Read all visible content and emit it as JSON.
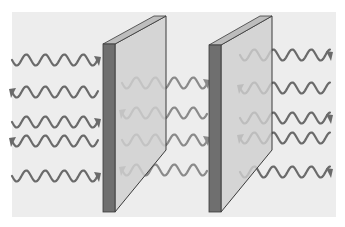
{
  "diagram": {
    "colors": {
      "canvas": "#ffffff",
      "background": "#ededed",
      "plate_face": "#cfcfcf",
      "plate_edge": "#6f6f6f",
      "plate_top": "#bdbdbd",
      "plate_outline": "#3a3a3a",
      "wave_outer": "#6a6a6a",
      "wave_inner": "#8a8a8a"
    },
    "plates": [
      {
        "id": "left-plate",
        "edge_x": 103,
        "face_x": 115,
        "right_x": 166,
        "top_y": 44,
        "top_right_y": 16,
        "bottom_y": 212,
        "bottom_right_y": 150
      },
      {
        "id": "right-plate",
        "edge_x": 209,
        "face_x": 221,
        "right_x": 272,
        "top_y": 45,
        "top_right_y": 16,
        "bottom_y": 212,
        "bottom_right_y": 150
      }
    ],
    "wave_groups": [
      {
        "region": "outside-left",
        "count": 5,
        "x_start": 12,
        "x_end": 98,
        "centers_y": [
          60,
          92,
          122,
          141,
          176
        ]
      },
      {
        "region": "between-plates",
        "count": 4,
        "x_start": 122,
        "x_end": 207,
        "centers_y": [
          83,
          113,
          140,
          170
        ]
      },
      {
        "region": "outside-right",
        "count": 5,
        "x_start": 240,
        "x_end": 330,
        "centers_y": [
          55,
          88,
          118,
          138,
          172
        ]
      }
    ]
  }
}
